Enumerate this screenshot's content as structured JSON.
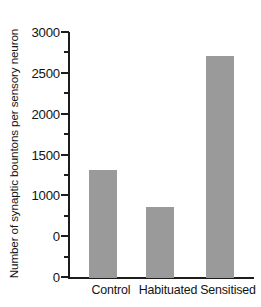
{
  "chart_data": {
    "type": "bar",
    "title": "",
    "xlabel": "",
    "ylabel": "Number of synaptic bountons per sensory neuron",
    "categories": [
      "Control",
      "Habituated",
      "Sensitised"
    ],
    "values": [
      1320,
      870,
      2720
    ],
    "series": [
      {
        "name": "Number of synaptic bountons per sensory neuron",
        "values": [
          1320,
          870,
          2720
        ]
      }
    ],
    "ylim": [
      0,
      3000
    ],
    "ytick_values": [
      0,
      500,
      1000,
      1500,
      2000,
      2500,
      3000
    ],
    "ytick_labels": [
      "0",
      "0",
      "1000",
      "1500",
      "2000",
      "2500",
      "3000"
    ],
    "minor_tick_values": [
      250,
      750,
      1250,
      1750,
      2250,
      2750
    ],
    "grid": false,
    "legend": false,
    "legend_position": "none",
    "bar_color": "#9a9a9a",
    "axis_color": "#1c1c1c",
    "background_color": "#ffffff"
  },
  "axis": {
    "y_title": "Number of synaptic bountons per sensory neuron",
    "y_labels": [
      {
        "value": 3000,
        "text": "3000"
      },
      {
        "value": 2500,
        "text": "2500"
      },
      {
        "value": 2000,
        "text": "2000"
      },
      {
        "value": 1500,
        "text": "1500"
      },
      {
        "value": 1000,
        "text": "1000"
      },
      {
        "value": 500,
        "text": "0"
      },
      {
        "value": 0,
        "text": "0"
      }
    ],
    "x_labels": [
      "Control",
      "Habituated",
      "Sensitised"
    ]
  },
  "bars": [
    {
      "label": "Control",
      "value": 1320
    },
    {
      "label": "Habituated",
      "value": 870
    },
    {
      "label": "Sensitised",
      "value": 2720
    }
  ]
}
